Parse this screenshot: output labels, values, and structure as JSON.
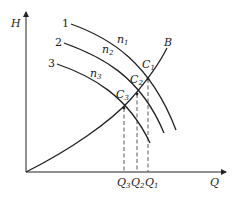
{
  "diagram": {
    "title": "",
    "axes": {
      "y_label": "H",
      "x_label": "Q"
    },
    "pump_curves": [
      {
        "id": "1",
        "label": "1",
        "speed_label": "n",
        "speed_sub": "1"
      },
      {
        "id": "2",
        "label": "2",
        "speed_label": "n",
        "speed_sub": "2"
      },
      {
        "id": "3",
        "label": "3",
        "speed_label": "n",
        "speed_sub": "3"
      }
    ],
    "system_curve": {
      "label": "B"
    },
    "operating_points": [
      {
        "label": "C",
        "sub": "1"
      },
      {
        "label": "C",
        "sub": "2"
      },
      {
        "label": "C",
        "sub": "3"
      }
    ],
    "flow_ticks": [
      {
        "label": "Q",
        "sub": "3"
      },
      {
        "label": "Q",
        "sub": "2"
      },
      {
        "label": "Q",
        "sub": "1"
      }
    ],
    "colors": {
      "line": "#222222",
      "background": "#ffffff"
    }
  }
}
